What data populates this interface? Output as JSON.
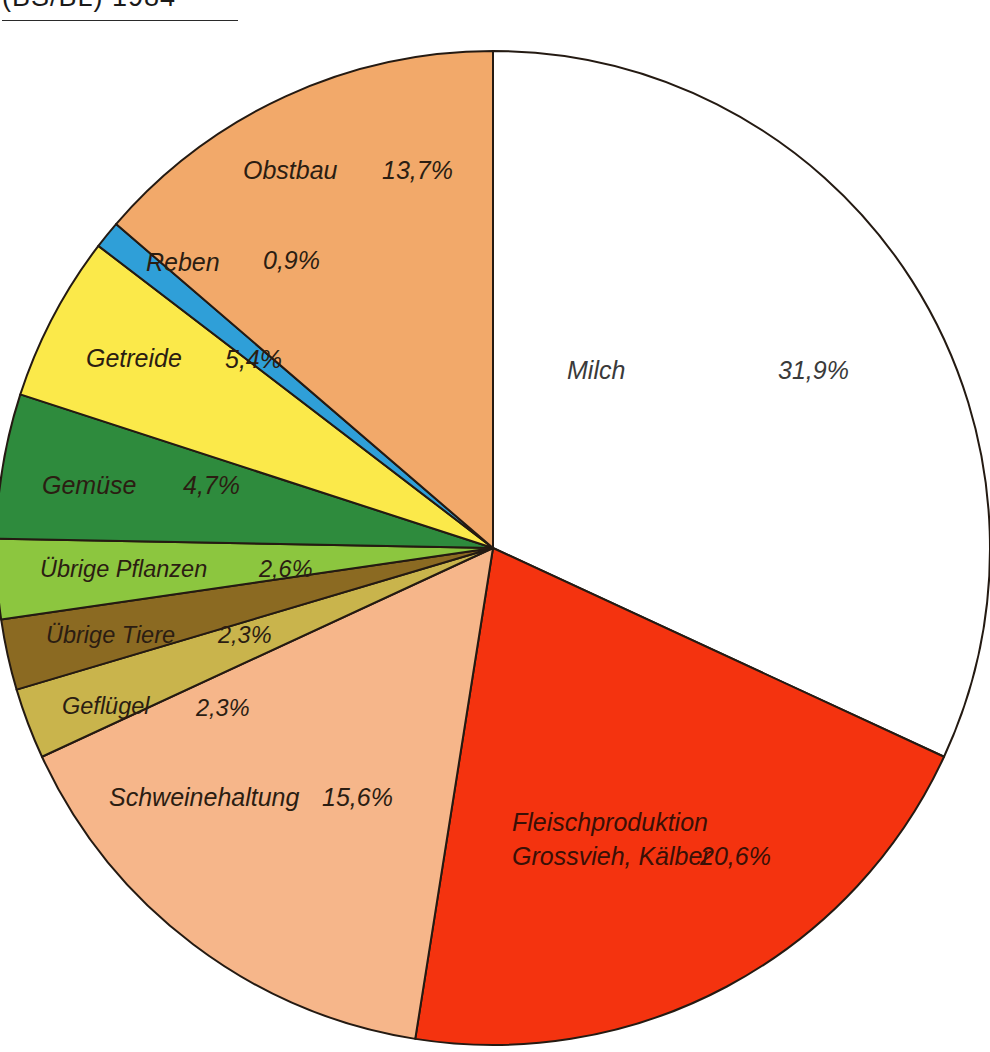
{
  "title": {
    "text": "(BS/BL) 1984"
  },
  "chart_data": {
    "type": "pie",
    "title": "(BS/BL) 1984",
    "xlabel": "",
    "ylabel": "",
    "units": "percent",
    "start_angle_deg": 0,
    "direction": "clockwise",
    "legend_position": "none",
    "grid": false,
    "labels": [
      "Milch",
      "Fleischproduktion Grossvieh, Kälber",
      "Schweinehaltung",
      "Geflügel",
      "Übrige Tiere",
      "Übrige Pflanzen",
      "Gemüse",
      "Getreide",
      "Reben",
      "Obstbau"
    ],
    "values": [
      31.9,
      20.6,
      15.6,
      2.3,
      2.3,
      2.6,
      4.7,
      5.4,
      0.9,
      13.7
    ],
    "value_labels": [
      "31,9%",
      "20,6%",
      "15,6%",
      "2,3%",
      "2,3%",
      "2,6%",
      "4,7%",
      "5,4%",
      "0,9%",
      "13,7%"
    ],
    "colors": [
      "#ffffff",
      "#f4330f",
      "#f6b68a",
      "#c9b44c",
      "#8b6a22",
      "#8cc63f",
      "#2e8b3d",
      "#fbe94a",
      "#2f9fd8",
      "#f2a96a"
    ],
    "slices": [
      {
        "name": "Milch",
        "label_line1": "Milch",
        "label_line2": "",
        "value": 31.9,
        "value_label": "31,9%",
        "color": "#ffffff",
        "label_x": 567,
        "label_y": 372,
        "value_x": 778,
        "value_y": 372,
        "text_tone": "on-white",
        "size": "normal"
      },
      {
        "name": "Fleischproduktion Grossvieh, Kälber",
        "label_line1": "Fleischproduktion",
        "label_line2": "Grossvieh, Kälber",
        "value": 20.6,
        "value_label": "20,6%",
        "color": "#f4330f",
        "label_x": 512,
        "label_y": 824,
        "value_x": 700,
        "value_y": 858,
        "text_tone": "on-red",
        "size": "normal"
      },
      {
        "name": "Schweinehaltung",
        "label_line1": "Schweinehaltung",
        "label_line2": "",
        "value": 15.6,
        "value_label": "15,6%",
        "color": "#f6b68a",
        "label_x": 109,
        "label_y": 799,
        "value_x": 322,
        "value_y": 799,
        "text_tone": "dark-on-light",
        "size": "normal"
      },
      {
        "name": "Geflügel",
        "label_line1": "Geflügel",
        "label_line2": "",
        "value": 2.3,
        "value_label": "2,3%",
        "color": "#c9b44c",
        "label_x": 62,
        "label_y": 708,
        "value_x": 196,
        "value_y": 710,
        "text_tone": "dark-on-light",
        "size": "small"
      },
      {
        "name": "Übrige Tiere",
        "label_line1": "Übrige Tiere",
        "label_line2": "",
        "value": 2.3,
        "value_label": "2,3%",
        "color": "#8b6a22",
        "label_x": 46,
        "label_y": 637,
        "value_x": 218,
        "value_y": 637,
        "text_tone": "dark-on-light",
        "size": "small"
      },
      {
        "name": "Übrige Pflanzen",
        "label_line1": "Übrige Pflanzen",
        "label_line2": "",
        "value": 2.6,
        "value_label": "2,6%",
        "color": "#8cc63f",
        "label_x": 40,
        "label_y": 571,
        "value_x": 259,
        "value_y": 571,
        "text_tone": "dark-on-light",
        "size": "small"
      },
      {
        "name": "Gemüse",
        "label_line1": "Gemüse",
        "label_line2": "",
        "value": 4.7,
        "value_label": "4,7%",
        "color": "#2e8b3d",
        "label_x": 42,
        "label_y": 487,
        "value_x": 183,
        "value_y": 487,
        "text_tone": "dark-on-light",
        "size": "normal"
      },
      {
        "name": "Getreide",
        "label_line1": "Getreide",
        "label_line2": "",
        "value": 5.4,
        "value_label": "5,4%",
        "color": "#fbe94a",
        "label_x": 86,
        "label_y": 360,
        "value_x": 225,
        "value_y": 361,
        "text_tone": "dark-on-light",
        "size": "normal"
      },
      {
        "name": "Reben",
        "label_line1": "Reben",
        "label_line2": "",
        "value": 0.9,
        "value_label": "0,9%",
        "color": "#2f9fd8",
        "label_x": 146,
        "label_y": 264,
        "value_x": 263,
        "value_y": 262,
        "text_tone": "dark-on-light",
        "size": "normal"
      },
      {
        "name": "Obstbau",
        "label_line1": "Obstbau",
        "label_line2": "",
        "value": 13.7,
        "value_label": "13,7%",
        "color": "#f2a96a",
        "label_x": 243,
        "label_y": 172,
        "value_x": 382,
        "value_y": 172,
        "text_tone": "dark-on-light",
        "size": "normal"
      }
    ],
    "geometry": {
      "center_x": 493,
      "center_y": 548,
      "radius": 497
    }
  }
}
